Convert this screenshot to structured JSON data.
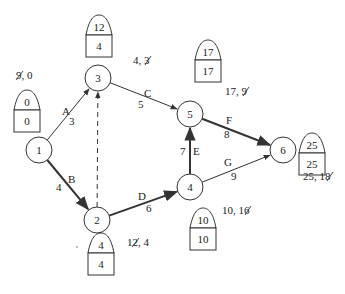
{
  "diagram": {
    "type": "activity-on-arrow network (critical path)",
    "nodes": [
      {
        "id": "1",
        "label": "1",
        "ls": "0",
        "es": "0",
        "annot": {
          "struck": "9",
          "rest": ", 0"
        }
      },
      {
        "id": "2",
        "label": "2",
        "ls": "4",
        "es": "4",
        "annot": {
          "pre": "1",
          "struck": "2",
          "rest": ", 4"
        }
      },
      {
        "id": "3",
        "label": "3",
        "ls": "12",
        "es": "4",
        "annot": {
          "pre": "4, ",
          "struck": "3",
          "rest": ""
        }
      },
      {
        "id": "4",
        "label": "4",
        "ls": "10",
        "es": "10",
        "annot": {
          "pre": "10, 1",
          "struck": "6",
          "rest": ""
        }
      },
      {
        "id": "5",
        "label": "5",
        "ls": "17",
        "es": "17",
        "annot": {
          "pre": "17, ",
          "struck": "9",
          "rest": ""
        }
      },
      {
        "id": "6",
        "label": "6",
        "ls": "25",
        "es": "25",
        "annot": {
          "pre": "25, 1",
          "struck": "8",
          "rest": ""
        }
      }
    ],
    "edges": [
      {
        "from": "1",
        "to": "3",
        "activity": "A",
        "duration": "3",
        "style": "thin"
      },
      {
        "from": "1",
        "to": "2",
        "activity": "B",
        "duration": "4",
        "style": "thick"
      },
      {
        "from": "3",
        "to": "5",
        "activity": "C",
        "duration": "5",
        "style": "thin"
      },
      {
        "from": "2",
        "to": "4",
        "activity": "D",
        "duration": "6",
        "style": "thick"
      },
      {
        "from": "4",
        "to": "5",
        "activity": "E",
        "duration": "7",
        "style": "thick"
      },
      {
        "from": "5",
        "to": "6",
        "activity": "F",
        "duration": "8",
        "style": "thick"
      },
      {
        "from": "4",
        "to": "6",
        "activity": "G",
        "duration": "9",
        "style": "thin"
      },
      {
        "from": "2",
        "to": "3",
        "activity": "",
        "duration": "",
        "style": "dashed"
      }
    ],
    "annotation_labels": {
      "n1": "9, 0",
      "n2": "12, 4",
      "n3": "4, 3",
      "n4": "10, 16",
      "n5": "17, 9",
      "n6": "25, 18"
    }
  }
}
